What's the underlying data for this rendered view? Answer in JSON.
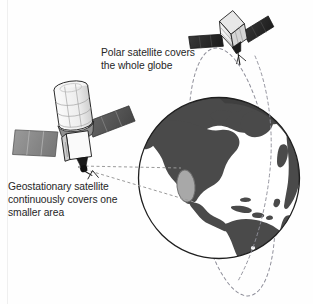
{
  "diagram": {
    "background_color": "#fefefe"
  },
  "captions": {
    "polar": {
      "text": "Polar satellite covers\nthe whole globe",
      "line1": "Polar satellite covers",
      "line2": "the whole globe",
      "color": "#262626"
    },
    "geostationary": {
      "text": "Geostationary satellite\ncontinuously covers one\nsmaller area",
      "line1": "Geostationary satellite",
      "line2": "continuously covers one",
      "line3": "smaller area",
      "color": "#262626"
    }
  },
  "globe": {
    "label": "Earth globe showing the Americas",
    "center_x": 219,
    "center_y": 178,
    "radius": 81,
    "ocean_color": "#ffffff",
    "land_color": "#4a4a4a",
    "outline_color": "#1a1a1a",
    "limb_shadow_color": "#3d3d3d",
    "landmasses": [
      "North America",
      "South America",
      "Greenland",
      "Caribbean islands",
      "Arctic archipelago",
      "Western Europe limb",
      "Africa limb"
    ]
  },
  "coverage_spot": {
    "label": "Geostationary coverage area",
    "color": "#a8a8a8",
    "outline_color": "#6b6b6b",
    "center_x": 186,
    "center_y": 186,
    "rx": 9,
    "ry": 16
  },
  "polar_orbit": {
    "label": "Polar orbit path",
    "style": "dashed",
    "color": "#8f8f9a",
    "dash": "3 3",
    "center_x": 232,
    "center_y": 172,
    "rx": 40,
    "ry": 125,
    "rotation_deg": -8
  },
  "coverage_cone": {
    "label": "Geostationary coverage beam",
    "style": "dashed",
    "color": "#9a9a9a",
    "dash": "3 2.5",
    "origin_x": 78,
    "origin_y": 166,
    "top_target_x": 182,
    "top_target_y": 170,
    "bottom_target_x": 192,
    "bottom_target_y": 202
  },
  "satellites": [
    {
      "id": "polar-satellite",
      "name": "Polar satellite",
      "x": 232,
      "y": 32,
      "body_color": "#f2f2f2",
      "body_outline": "#1f1f1f",
      "panel_color": "#2e2e2e",
      "antenna_color": "#1a1a1a"
    },
    {
      "id": "geostationary-satellite",
      "name": "Geostationary satellite",
      "x": 72,
      "y": 130,
      "body_color": "#f4f4f4",
      "body_outline": "#1f1f1f",
      "panel_color_left": "#8c8c8c",
      "panel_color_right": "#5c5c5c",
      "antenna_color": "#1a1a1a"
    }
  ],
  "edge_line": {
    "label": "left margin scan line",
    "color": "#efefef"
  }
}
